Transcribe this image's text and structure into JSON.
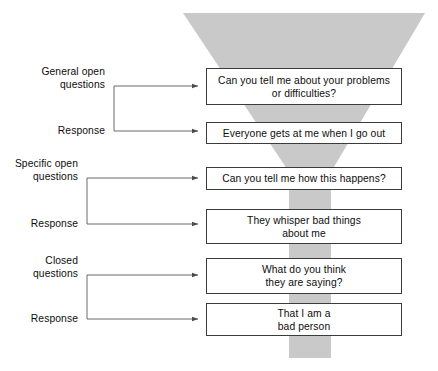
{
  "diagram": {
    "funnel": {
      "color": "#c9c9c9",
      "shape": "inverted-trapezoid-with-stem"
    },
    "line_color": "#555555",
    "box_border_color": "#3b3b3b"
  },
  "steps": [
    {
      "label": "General open\nquestions",
      "label_name": "general-open-questions",
      "message": "Can you tell me about your problems or difficulties?",
      "message_lines": [
        "Can you tell me about your problems",
        "or difficulties?"
      ]
    },
    {
      "label": "Response",
      "label_name": "response-1",
      "message": "Everyone gets at me when I go out",
      "message_lines": [
        "Everyone gets at me when I go out"
      ]
    },
    {
      "label": "Specific open\nquestions",
      "label_name": "specific-open-questions",
      "message": "Can you tell me how this happens?",
      "message_lines": [
        "Can you tell me how this happens?"
      ]
    },
    {
      "label": "Response",
      "label_name": "response-2",
      "message": "They whisper bad things about me",
      "message_lines": [
        "They whisper bad things",
        "about me"
      ]
    },
    {
      "label": "Closed\nquestions",
      "label_name": "closed-questions",
      "message": "What do you think they are saying?",
      "message_lines": [
        "What do you think",
        "they are saying?"
      ]
    },
    {
      "label": "Response",
      "label_name": "response-3",
      "message": "That I am a bad person",
      "message_lines": [
        "That I am a",
        "bad person"
      ]
    }
  ]
}
